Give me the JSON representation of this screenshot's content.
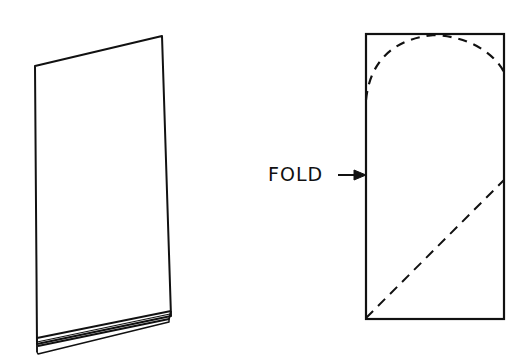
{
  "diagram": {
    "left_figure": {
      "name": "folded-paper-sheet"
    },
    "right_figure": {
      "name": "cutting-pattern",
      "fold_label": "FOLD",
      "stroke_color": "#111111"
    }
  }
}
